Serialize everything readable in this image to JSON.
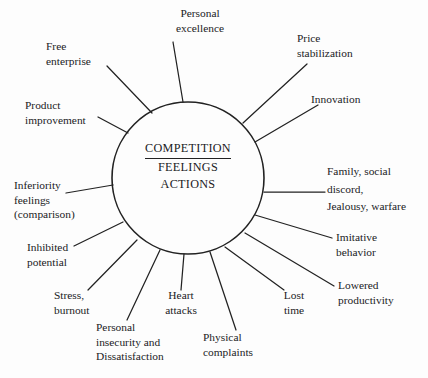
{
  "diagram": {
    "type": "radial-spoke-diagram",
    "title": "COMPETITION",
    "hub": {
      "line1": "COMPETITION",
      "line2": "FEELINGS",
      "line3": "ACTIONS"
    },
    "colors": {
      "background": "#fdfdfd",
      "ink": "#1b1b1d",
      "stroke": "#222222"
    },
    "circle": {
      "cx": 188,
      "cy": 178,
      "r": 76
    },
    "nodes": [
      {
        "id": "personal-excellence",
        "lines": [
          "Personal",
          "excellence"
        ],
        "align": "center",
        "x": 160,
        "y": 6,
        "angle_deg": -86,
        "spoke": {
          "x1": 183,
          "y1": 102,
          "x2": 173,
          "y2": 42
        }
      },
      {
        "id": "price-stabilization",
        "lines": [
          "Price",
          "stabilization"
        ],
        "align": "left",
        "x": 297,
        "y": 31,
        "angle_deg": -50,
        "spoke": {
          "x1": 243,
          "y1": 123,
          "x2": 307,
          "y2": 64
        }
      },
      {
        "id": "innovation",
        "lines": [
          "Innovation"
        ],
        "align": "left",
        "x": 311,
        "y": 92,
        "angle_deg": -32,
        "spoke": {
          "x1": 255,
          "y1": 142,
          "x2": 318,
          "y2": 105
        }
      },
      {
        "id": "family-social-discord",
        "lines": [
          "Family, social",
          "discord,",
          "Jealousy, warfare"
        ],
        "align": "left",
        "x": 327,
        "y": 165,
        "angle_deg": 0,
        "spoke": {
          "x1": 264,
          "y1": 192,
          "x2": 325,
          "y2": 192
        }
      },
      {
        "id": "imitative-behavior",
        "lines": [
          "Imitative",
          "behavior"
        ],
        "align": "left",
        "x": 336,
        "y": 230,
        "angle_deg": 25,
        "spoke": {
          "x1": 255,
          "y1": 215,
          "x2": 332,
          "y2": 238
        }
      },
      {
        "id": "lowered-productivity",
        "lines": [
          "Lowered",
          "productivity"
        ],
        "align": "left",
        "x": 338,
        "y": 278,
        "angle_deg": 42,
        "spoke": {
          "x1": 245,
          "y1": 233,
          "x2": 334,
          "y2": 286
        }
      },
      {
        "id": "lost-time",
        "lines": [
          "Lost",
          "time"
        ],
        "align": "center",
        "x": 271,
        "y": 288,
        "angle_deg": 62,
        "spoke": {
          "x1": 225,
          "y1": 247,
          "x2": 284,
          "y2": 290
        }
      },
      {
        "id": "physical-complaints",
        "lines": [
          "Physical",
          "complaints"
        ],
        "align": "left",
        "x": 203,
        "y": 330,
        "angle_deg": 76,
        "spoke": {
          "x1": 210,
          "y1": 252,
          "x2": 236,
          "y2": 330
        }
      },
      {
        "id": "heart-attacks",
        "lines": [
          "Heart",
          "attacks"
        ],
        "align": "center",
        "x": 159,
        "y": 288,
        "angle_deg": 90,
        "spoke": {
          "x1": 184,
          "y1": 254,
          "x2": 181,
          "y2": 290
        }
      },
      {
        "id": "personal-insecurity",
        "lines": [
          "Personal",
          "insecurity and",
          "Dissatisfaction"
        ],
        "align": "left",
        "x": 96,
        "y": 320,
        "angle_deg": 108,
        "spoke": {
          "x1": 160,
          "y1": 250,
          "x2": 127,
          "y2": 320
        }
      },
      {
        "id": "stress-burnout",
        "lines": [
          "Stress,",
          "burnout"
        ],
        "align": "left",
        "x": 54,
        "y": 288,
        "angle_deg": 126,
        "spoke": {
          "x1": 137,
          "y1": 240,
          "x2": 88,
          "y2": 290
        }
      },
      {
        "id": "inhibited-potential",
        "lines": [
          "Inhibited",
          "potential"
        ],
        "align": "left",
        "x": 27,
        "y": 240,
        "angle_deg": 143,
        "spoke": {
          "x1": 123,
          "y1": 222,
          "x2": 74,
          "y2": 246
        }
      },
      {
        "id": "inferiority-feelings",
        "lines": [
          "Inferiority",
          "feelings",
          "(comparison)"
        ],
        "align": "left",
        "x": 14,
        "y": 180,
        "angle_deg": 174,
        "spoke": {
          "x1": 113,
          "y1": 185,
          "x2": 66,
          "y2": 193
        }
      },
      {
        "id": "product-improvement",
        "lines": [
          "Product",
          "improvement"
        ],
        "align": "left",
        "x": 25,
        "y": 98,
        "angle_deg": 213,
        "spoke": {
          "x1": 128,
          "y1": 133,
          "x2": 98,
          "y2": 117
        }
      },
      {
        "id": "free-enterprise",
        "lines": [
          "Free",
          "enterprise"
        ],
        "align": "left",
        "x": 46,
        "y": 39,
        "angle_deg": 232,
        "spoke": {
          "x1": 152,
          "y1": 113,
          "x2": 107,
          "y2": 66
        }
      }
    ]
  }
}
